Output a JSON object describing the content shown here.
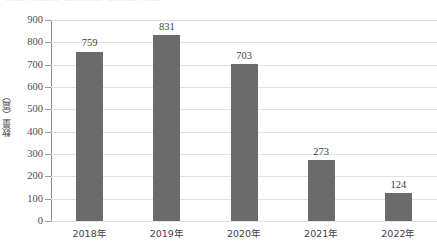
{
  "figure": {
    "top_cut_text": "——  ———   ————        ———  ——",
    "background_color": "#ffffff",
    "bar_color": "#6b6b6b",
    "gridline_color": "#e2e2e2",
    "axis_color": "#8c8c8c",
    "text_color": "#3d3d3d"
  },
  "chart_data": {
    "type": "bar",
    "title": "",
    "xlabel": "",
    "ylabel": "数量（篇）",
    "categories": [
      "2018年",
      "2019年",
      "2020年",
      "2021年",
      "2022年"
    ],
    "values": [
      759,
      831,
      703,
      273,
      124
    ],
    "value_labels": [
      "759",
      "831",
      "703",
      "273",
      "124"
    ],
    "ylim": [
      0,
      900
    ],
    "ytick_step": 100,
    "yticks": [
      0,
      100,
      200,
      300,
      400,
      500,
      600,
      700,
      800,
      900
    ],
    "ytick_labels": [
      "0",
      "100",
      "200",
      "300",
      "400",
      "500",
      "600",
      "700",
      "800",
      "900"
    ],
    "grid": true,
    "grid_axis": "y",
    "legend": false,
    "legend_position": "none",
    "series": [
      {
        "name": "数量（篇）",
        "values": [
          759,
          831,
          703,
          273,
          124
        ],
        "color": "#6b6b6b"
      }
    ]
  }
}
